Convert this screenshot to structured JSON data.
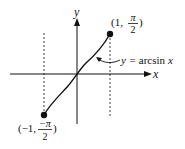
{
  "diagram": {
    "axes": {
      "x_label": "x",
      "y_label": "y"
    },
    "curve": {
      "label_y": "y = ",
      "label_fn": "arcsin",
      "label_x": "x"
    },
    "points": [
      {
        "name": "upper-endpoint",
        "x_text": "(1, ",
        "num": "π",
        "den": "2",
        "close": ")"
      },
      {
        "name": "lower-endpoint",
        "x_text": "(−1, ",
        "num": "−π",
        "den": "2",
        "close": ")"
      }
    ],
    "colors": {
      "ink": "#111111",
      "background": "#ffffff"
    }
  }
}
